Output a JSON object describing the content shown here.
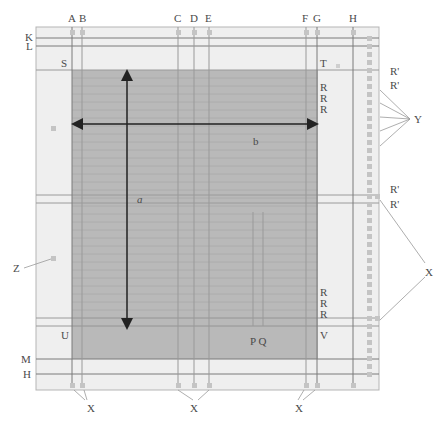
{
  "diagram": {
    "type": "page-layout-grid",
    "colors": {
      "page": "#efefef",
      "text_block": "#b9b9b9",
      "baseline": "#a6a6a6",
      "guide": "#7a7a7a",
      "marker": "#c4c4c4",
      "arrow": "#222222",
      "label": "#4a4a4a",
      "leader": "#999999"
    },
    "top_labels": {
      "A": "A",
      "B": "B",
      "C": "C",
      "D": "D",
      "E": "E",
      "F": "F",
      "G": "G",
      "H": "H"
    },
    "left_labels": {
      "K": "K",
      "L": "L",
      "M": "M",
      "H": "H",
      "Z": "Z"
    },
    "corner_labels": {
      "S": "S",
      "T": "T",
      "U": "U",
      "V": "V"
    },
    "right_labels": {
      "r_prime_1": "R'",
      "r_prime_2": "R'",
      "r_prime_3": "R'",
      "r_prime_4": "R'",
      "Y": "Y",
      "X": "X"
    },
    "r_labels_top": [
      "R",
      "R",
      "R"
    ],
    "r_labels_bottom": [
      "R",
      "R",
      "R"
    ],
    "inner_labels": {
      "a": "a",
      "b": "b",
      "PQ": "P Q"
    },
    "bottom_labels": {
      "x1": "X",
      "x2": "X",
      "x3": "X"
    }
  }
}
